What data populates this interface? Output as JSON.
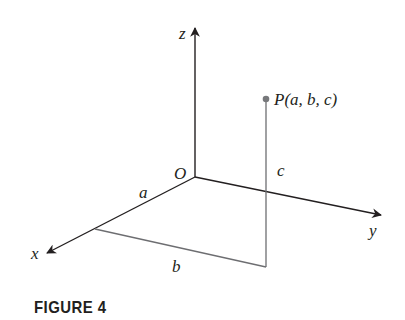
{
  "figure": {
    "caption": "FIGURE 4",
    "axes": {
      "x": "x",
      "y": "y",
      "z": "z"
    },
    "origin_label": "O",
    "point_label": "P(a, b, c)",
    "point": {
      "name": "P",
      "coords": [
        "a",
        "b",
        "c"
      ]
    },
    "segment_labels": {
      "a": "a",
      "b": "b",
      "c": "c"
    },
    "colors": {
      "axis": "#231f20",
      "projection": "#6d6e71",
      "point": "#77787b"
    }
  }
}
